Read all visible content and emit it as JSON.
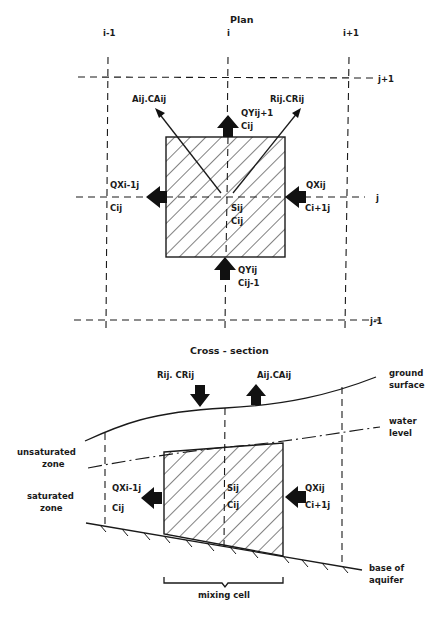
{
  "plan": {
    "title": "Plan",
    "columns": [
      "i-1",
      "i",
      "i+1"
    ],
    "rows": [
      "j+1",
      "j",
      "j-1"
    ],
    "labels": {
      "evap": "Aij.CAij",
      "recharge": "Rij.CRij",
      "qy_out_1": "QYij+1",
      "qy_out_2": "Cij",
      "qx_out_1": "QXi-1j",
      "qx_out_2": "Cij",
      "qx_in_1": "QXij",
      "qx_in_2": "Ci+1j",
      "source_1": "Sij",
      "source_2": "Cij",
      "qy_in_1": "QYij",
      "qy_in_2": "Cij-1"
    }
  },
  "cross_section": {
    "title": "Cross - section",
    "labels": {
      "recharge": "Rij. CRij",
      "evap": "Aij.CAij",
      "ground_1": "ground",
      "ground_2": "surface",
      "water_1": "water",
      "water_2": "level",
      "unsat_1": "unsaturated",
      "unsat_2": "zone",
      "sat_1": "saturated",
      "sat_2": "zone",
      "qx_out_1": "QXi-1j",
      "qx_out_2": "Cij",
      "source_1": "Sij",
      "source_2": "Cij",
      "qx_in_1": "QXij",
      "qx_in_2": "Ci+1j",
      "base_1": "base of",
      "base_2": "aquifer",
      "mixing_cell": "mixing cell"
    }
  }
}
